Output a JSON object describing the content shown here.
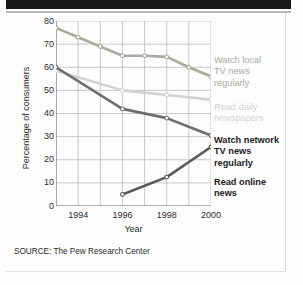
{
  "figure": {
    "source_note": "SOURCE: The Pew Research Center"
  },
  "chart_data": {
    "type": "line",
    "title": "",
    "xlabel": "Year",
    "ylabel": "Percentage of consumers",
    "xlim": [
      1993,
      2000
    ],
    "ylim": [
      0,
      80
    ],
    "grid": true,
    "legend_position": "right",
    "xticks": [
      "1994",
      "1996",
      "1998",
      "2000"
    ],
    "xtick_values": [
      1994,
      1996,
      1998,
      2000
    ],
    "xminor_values": [
      1993,
      1995,
      1997,
      1999
    ],
    "yticks": [
      "0",
      "10",
      "20",
      "30",
      "40",
      "50",
      "60",
      "70",
      "80"
    ],
    "ytick_values": [
      0,
      10,
      20,
      30,
      40,
      50,
      60,
      70,
      80
    ],
    "series": [
      {
        "name": "Watch local TV news regularly",
        "legend_label": "Watch local\nTV news\nregularly",
        "legend_lines": [
          "Watch local",
          "TV news",
          "regularly"
        ],
        "color": "#a7aca3",
        "x": [
          1993,
          1994,
          1995,
          1996,
          1997,
          1998,
          1999,
          2000
        ],
        "values": [
          77,
          73,
          69,
          65,
          65,
          64.5,
          60,
          56
        ]
      },
      {
        "name": "Read daily newspapers",
        "legend_label": "Read daily\nnewspapers",
        "legend_lines": [
          "Read daily",
          "newspapers"
        ],
        "color": "#d2d2d2",
        "x": [
          1993,
          1996,
          1998,
          2000
        ],
        "values": [
          58.5,
          50,
          48,
          46
        ]
      },
      {
        "name": "Watch network TV news regularly",
        "legend_label": "Watch network\nTV news\nregularly",
        "legend_lines": [
          "Watch network",
          "TV news",
          "regularly"
        ],
        "color": "#6e6e6e",
        "x": [
          1993,
          1996,
          1998,
          2000
        ],
        "values": [
          60,
          42,
          38,
          30.5
        ]
      },
      {
        "name": "Read online news",
        "legend_label": "Read online\nnews",
        "legend_lines": [
          "Read online",
          "news"
        ],
        "color": "#5a5a5a",
        "x": [
          1996,
          1998,
          2000
        ],
        "values": [
          5,
          12.5,
          25.5
        ]
      }
    ]
  }
}
